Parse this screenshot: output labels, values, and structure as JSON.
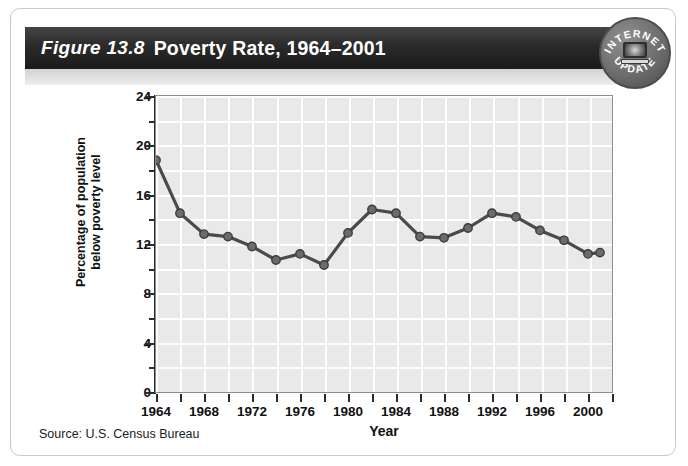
{
  "figure": {
    "number": "Figure 13.8",
    "title": "Poverty Rate, 1964–2001",
    "source": "Source: U.S. Census Bureau"
  },
  "badge": {
    "line1": "INTERNET",
    "line2": "UPDATE",
    "icon": "computer-monitor-icon"
  },
  "colors": {
    "banner_dark": "#1b1b1b",
    "plot_background": "#e9e9e9",
    "gridline": "#ffffff",
    "line_series": "#4a4a4a",
    "axis": "#2b2b2b",
    "card_border": "#c9c9c9"
  },
  "chart_data": {
    "type": "line",
    "title": "Poverty Rate, 1964–2001",
    "xlabel": "Year",
    "ylabel": "Percentage of population below poverty level",
    "ylabel_line1": "Percentage of population",
    "ylabel_line2": "below poverty level",
    "xlim": [
      1964,
      2002
    ],
    "ylim": [
      0,
      24
    ],
    "yticks": [
      0,
      4,
      8,
      12,
      16,
      20,
      24
    ],
    "yticks_minor": [
      2,
      6,
      10,
      14,
      18,
      22
    ],
    "ytick_labels": [
      "0",
      "4",
      "8",
      "12",
      "16",
      "20",
      "24"
    ],
    "xticks": [
      1964,
      1966,
      1968,
      1970,
      1972,
      1974,
      1976,
      1978,
      1980,
      1982,
      1984,
      1986,
      1988,
      1990,
      1992,
      1994,
      1996,
      1998,
      2000,
      2002
    ],
    "xtick_labels_shown": [
      "1964",
      "1968",
      "1972",
      "1976",
      "1980",
      "1984",
      "1988",
      "1992",
      "1996",
      "2000"
    ],
    "xtick_labeled_values": [
      1964,
      1968,
      1972,
      1976,
      1980,
      1984,
      1988,
      1992,
      1996,
      2000
    ],
    "grid": true,
    "legend": null,
    "markers": true,
    "x": [
      1964,
      1966,
      1968,
      1970,
      1972,
      1974,
      1976,
      1978,
      1980,
      1982,
      1984,
      1986,
      1988,
      1990,
      1992,
      1994,
      1996,
      1998,
      2000,
      2001
    ],
    "values": [
      18.8,
      14.5,
      12.8,
      12.6,
      11.8,
      10.7,
      11.2,
      10.3,
      12.9,
      14.8,
      14.5,
      12.6,
      12.5,
      13.3,
      14.5,
      14.2,
      13.1,
      12.3,
      11.2,
      11.3
    ],
    "series": [
      {
        "name": "Poverty rate",
        "values": [
          18.8,
          14.5,
          12.8,
          12.6,
          11.8,
          10.7,
          11.2,
          10.3,
          12.9,
          14.8,
          14.5,
          12.6,
          12.5,
          13.3,
          14.5,
          14.2,
          13.1,
          12.3,
          11.2,
          11.3
        ]
      }
    ]
  }
}
